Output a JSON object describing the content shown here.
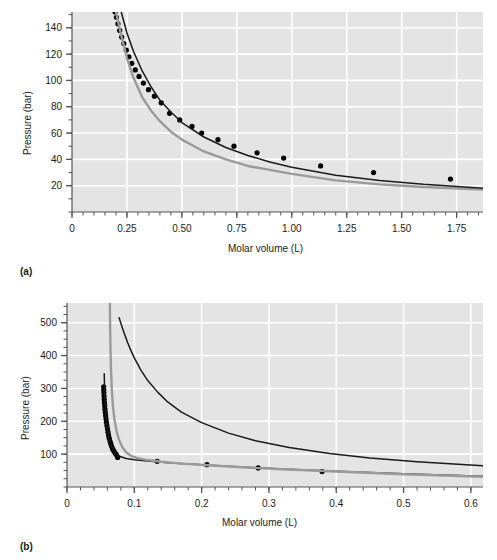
{
  "figure": {
    "panels": [
      {
        "caption": "(a)",
        "xlabel": "Molar volume (L)",
        "ylabel": "Pressure (bar)"
      },
      {
        "caption": "(b)",
        "xlabel": "Molar volume (L)",
        "ylabel": "Pressure (bar)"
      }
    ],
    "colors": {
      "plot_background": "#e4e4e4",
      "gridline": "#ffffff",
      "axis": "#555555",
      "series_black": "#1a1a1a",
      "series_gray": "#9a9a9a",
      "marker": "#000000",
      "text": "#1a1a1a"
    }
  },
  "chart_data": [
    {
      "type": "line",
      "title": "(a)",
      "xlabel": "Molar volume (L)",
      "ylabel": "Pressure (bar)",
      "xlim": [
        0,
        1.87
      ],
      "ylim": [
        0,
        152
      ],
      "xticks": [
        0,
        0.25,
        0.5,
        0.75,
        1.0,
        1.25,
        1.5,
        1.75
      ],
      "xticklabels": [
        "0",
        "0.25",
        "0.50",
        "0.75",
        "1.00",
        "1.25",
        "1.50",
        "1.75"
      ],
      "yticks": [
        20,
        40,
        60,
        80,
        100,
        120,
        140
      ],
      "yticklabels": [
        "20",
        "40",
        "60",
        "80",
        "100",
        "120",
        "140"
      ],
      "xminorstep": 0.05,
      "yminorstep": 10,
      "grid": true,
      "legend": "none",
      "series": [
        {
          "name": "experimental data",
          "style": "markers",
          "color": "#000000",
          "x": [
            0.196,
            0.202,
            0.209,
            0.217,
            0.226,
            0.236,
            0.247,
            0.259,
            0.272,
            0.288,
            0.305,
            0.325,
            0.348,
            0.375,
            0.406,
            0.444,
            0.49,
            0.546,
            0.59,
            0.664,
            0.737,
            0.842,
            0.963,
            1.131,
            1.372,
            1.722
          ],
          "y": [
            152,
            148,
            143,
            138,
            133,
            128,
            123,
            118,
            113,
            108,
            103,
            98,
            93,
            88,
            83,
            75,
            70,
            65,
            60,
            55,
            50,
            45,
            41,
            35,
            30,
            25,
            20
          ]
        },
        {
          "name": "van der Waals isotherm",
          "style": "line",
          "color": "#9a9a9a",
          "x": [
            0.2,
            0.22,
            0.25,
            0.28,
            0.32,
            0.36,
            0.4,
            0.45,
            0.5,
            0.6,
            0.7,
            0.8,
            0.9,
            1.0,
            1.2,
            1.4,
            1.6,
            1.87
          ],
          "y": [
            152,
            137,
            117,
            102,
            87,
            77,
            69,
            61,
            55,
            46,
            40,
            35,
            32,
            29,
            24,
            21,
            19,
            17
          ]
        },
        {
          "name": "ideal gas isotherm",
          "style": "line",
          "color": "#1a1a1a",
          "x": [
            0.224,
            0.25,
            0.28,
            0.32,
            0.36,
            0.4,
            0.45,
            0.5,
            0.6,
            0.7,
            0.8,
            0.9,
            1.0,
            1.2,
            1.4,
            1.6,
            1.87
          ],
          "y": [
            152,
            136,
            122,
            107,
            95,
            85,
            76,
            68,
            57,
            49,
            43,
            38,
            34,
            28,
            24,
            21,
            18
          ]
        }
      ]
    },
    {
      "type": "line",
      "title": "(b)",
      "xlabel": "Molar volume (L)",
      "ylabel": "Pressure (bar)",
      "xlim": [
        0,
        0.618
      ],
      "ylim": [
        0,
        560
      ],
      "xticks": [
        0,
        0.1,
        0.2,
        0.3,
        0.4,
        0.5,
        0.6
      ],
      "xticklabels": [
        "0",
        "0.1",
        "0.2",
        "0.3",
        "0.4",
        "0.5",
        "0.6"
      ],
      "yticks": [
        100,
        200,
        300,
        400,
        500
      ],
      "yticklabels": [
        "100",
        "200",
        "300",
        "400",
        "500"
      ],
      "xminorstep": 0.02,
      "yminorstep": 25,
      "grid": true,
      "legend": "none",
      "series": [
        {
          "name": "experimental data",
          "style": "markers",
          "color": "#000000",
          "x": [
            0.0545,
            0.0546,
            0.0548,
            0.055,
            0.0553,
            0.0556,
            0.056,
            0.0564,
            0.0569,
            0.0574,
            0.058,
            0.0586,
            0.0593,
            0.0601,
            0.0609,
            0.0618,
            0.0628,
            0.0639,
            0.0651,
            0.0664,
            0.0678,
            0.0694,
            0.0711,
            0.073,
            0.0752,
            0.134,
            0.208,
            0.284,
            0.379
          ],
          "y": [
            305,
            296,
            287,
            277,
            267,
            257,
            247,
            237,
            227,
            217,
            207,
            197,
            187,
            177,
            167,
            157,
            148,
            139,
            131,
            123,
            116,
            110,
            104,
            99,
            90,
            78,
            68,
            58,
            47
          ]
        },
        {
          "name": "van der Waals isotherm",
          "style": "line",
          "color": "#1a1a1a",
          "x": [
            0.0553,
            0.0556,
            0.056,
            0.0566,
            0.0574,
            0.0585,
            0.06,
            0.062,
            0.065,
            0.069,
            0.074,
            0.08,
            0.088,
            0.1,
            0.12,
            0.15,
            0.2,
            0.26,
            0.32,
            0.4,
            0.5,
            0.618
          ],
          "y": [
            345,
            320,
            290,
            260,
            230,
            200,
            172,
            148,
            128,
            112,
            100,
            92,
            87,
            83,
            79,
            74,
            68,
            61,
            55,
            48,
            40,
            33
          ]
        },
        {
          "name": "Redlich-Kwong isotherm",
          "style": "line",
          "color": "#9a9a9a",
          "x": [
            0.0637,
            0.064,
            0.0645,
            0.0653,
            0.0665,
            0.0682,
            0.0705,
            0.0735,
            0.0775,
            0.0825,
            0.088,
            0.095,
            0.105,
            0.12,
            0.14,
            0.17,
            0.21,
            0.26,
            0.32,
            0.4,
            0.5,
            0.618
          ],
          "y": [
            560,
            500,
            430,
            360,
            300,
            248,
            205,
            170,
            142,
            120,
            105,
            95,
            88,
            82,
            77,
            71,
            66,
            60,
            54,
            47,
            39,
            31
          ]
        },
        {
          "name": "ideal gas isotherm",
          "style": "line",
          "color": "#1a1a1a",
          "x": [
            0.0775,
            0.08,
            0.085,
            0.09,
            0.095,
            0.1,
            0.11,
            0.12,
            0.135,
            0.15,
            0.17,
            0.2,
            0.24,
            0.28,
            0.33,
            0.39,
            0.45,
            0.52,
            0.618
          ],
          "y": [
            515,
            498,
            468,
            440,
            415,
            393,
            355,
            324,
            288,
            258,
            228,
            196,
            164,
            141,
            120,
            102,
            88,
            77,
            65
          ]
        }
      ]
    }
  ]
}
